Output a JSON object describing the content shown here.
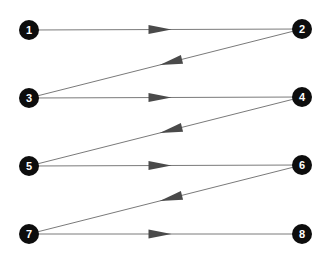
{
  "diagram": {
    "type": "directed-graph",
    "colors": {
      "background": "#ffffff",
      "node_fill": "#0d0d0d",
      "node_text": "#ffffff",
      "edge": "#7a7a7a",
      "arrowhead": "#4a4a4a"
    },
    "nodes": [
      {
        "id": "1",
        "label": "1",
        "x": 29,
        "y": 30
      },
      {
        "id": "2",
        "label": "2",
        "x": 302,
        "y": 29
      },
      {
        "id": "3",
        "label": "3",
        "x": 29,
        "y": 98
      },
      {
        "id": "4",
        "label": "4",
        "x": 302,
        "y": 97
      },
      {
        "id": "5",
        "label": "5",
        "x": 29,
        "y": 166
      },
      {
        "id": "6",
        "label": "6",
        "x": 302,
        "y": 165
      },
      {
        "id": "7",
        "label": "7",
        "x": 29,
        "y": 234
      },
      {
        "id": "8",
        "label": "8",
        "x": 302,
        "y": 234
      }
    ],
    "edges": [
      {
        "from": "1",
        "to": "2"
      },
      {
        "from": "2",
        "to": "3"
      },
      {
        "from": "3",
        "to": "4"
      },
      {
        "from": "4",
        "to": "5"
      },
      {
        "from": "5",
        "to": "6"
      },
      {
        "from": "6",
        "to": "7"
      },
      {
        "from": "7",
        "to": "8"
      }
    ]
  }
}
